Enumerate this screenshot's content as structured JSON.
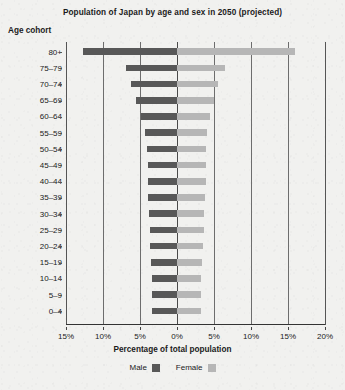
{
  "chart_data": {
    "type": "bar",
    "subtype": "population-pyramid",
    "title": "Population of Japan by age and sex in 2050 (projected)",
    "xlabel": "Percentage of total population",
    "ylabel": "Age cohort",
    "xlim": [
      -15,
      20
    ],
    "grid": true,
    "legend_position": "bottom",
    "xtick_labels": [
      "15%",
      "10%",
      "5%",
      "0%",
      "5%",
      "10%",
      "15%",
      "20%"
    ],
    "xtick_values": [
      -15,
      -10,
      -5,
      0,
      5,
      10,
      15,
      20
    ],
    "categories": [
      "80+",
      "75–79",
      "70–74",
      "65–69",
      "60–64",
      "55–59",
      "50–54",
      "45–49",
      "40–44",
      "35–39",
      "30–34",
      "25–29",
      "20–24",
      "15–19",
      "10–14",
      "5–9",
      "0–4"
    ],
    "series": [
      {
        "name": "Male",
        "color": "#585858",
        "side": "left",
        "values": [
          12.7,
          6.9,
          6.2,
          5.6,
          4.8,
          4.3,
          4.1,
          3.9,
          3.9,
          3.9,
          3.8,
          3.7,
          3.6,
          3.5,
          3.4,
          3.4,
          3.4
        ]
      },
      {
        "name": "Female",
        "color": "#b6b6b6",
        "side": "right",
        "values": [
          16.0,
          6.5,
          5.6,
          5.0,
          4.4,
          4.1,
          3.9,
          3.9,
          3.9,
          3.8,
          3.7,
          3.6,
          3.5,
          3.4,
          3.3,
          3.3,
          3.3
        ]
      }
    ]
  },
  "legend": {
    "items": [
      {
        "label": "Male"
      },
      {
        "label": "Female"
      }
    ]
  }
}
